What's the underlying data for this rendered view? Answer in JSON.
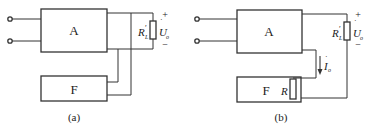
{
  "figure": {
    "colors": {
      "line": "#333333",
      "text": "#222222",
      "background": "#ffffff"
    },
    "panels": [
      {
        "id": "a",
        "caption": "(a)",
        "blocks": {
          "amplifier": "A",
          "feedback": "F"
        },
        "load": {
          "name": "R",
          "sub": "L",
          "prime": "′"
        },
        "output_voltage": {
          "name": "U",
          "sub": "o",
          "dot": "·"
        },
        "polarity": {
          "plus": "+",
          "minus": "−"
        }
      },
      {
        "id": "b",
        "caption": "(b)",
        "blocks": {
          "amplifier": "A",
          "feedback": "F"
        },
        "load": {
          "name": "R",
          "sub": "L",
          "prime": "′"
        },
        "output_voltage": {
          "name": "U",
          "sub": "o",
          "dot": "·"
        },
        "output_current": {
          "name": "I",
          "sub": "o",
          "dot": "·"
        },
        "feedback_resistor": "R",
        "polarity": {
          "plus": "+",
          "minus": "−"
        }
      }
    ]
  }
}
